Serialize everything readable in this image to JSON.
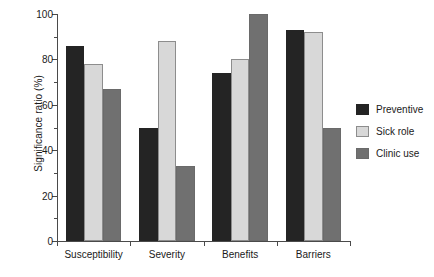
{
  "chart_data": {
    "type": "bar",
    "title": "",
    "xlabel": "",
    "ylabel": "Significance ratio (%)",
    "categories": [
      "Susceptibility",
      "Severity",
      "Benefits",
      "Barriers"
    ],
    "series": [
      {
        "name": "Preventive",
        "color": "#242424",
        "values": [
          86,
          50,
          74,
          93
        ]
      },
      {
        "name": "Sick role",
        "color": "#d8d8d8",
        "values": [
          78,
          88,
          80,
          92
        ]
      },
      {
        "name": "Clinic use",
        "color": "#707070",
        "values": [
          67,
          33,
          100,
          50
        ]
      }
    ],
    "ylim": [
      0,
      100
    ],
    "yticks": [
      0,
      20,
      40,
      60,
      80,
      100
    ],
    "ytick_labels": [
      "0",
      "20",
      "40",
      "60",
      "80",
      "100"
    ],
    "yminor_ticks": [
      10,
      30,
      50,
      70,
      90
    ],
    "grid": false,
    "legend_position": "right"
  }
}
